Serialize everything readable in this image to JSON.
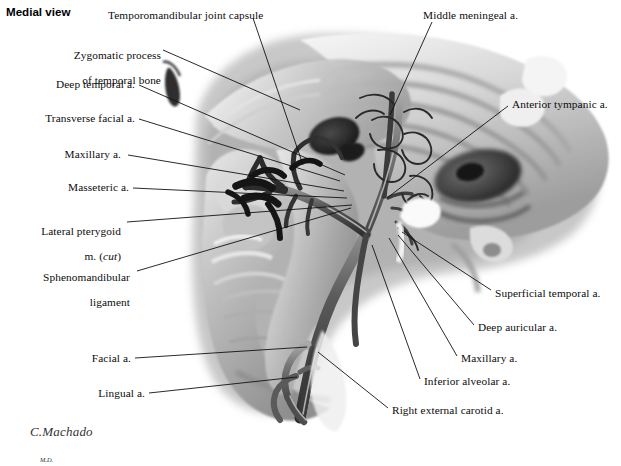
{
  "plate": {
    "title": "Medial view",
    "background_color": "#ffffff",
    "text_color": "#0c0c0c",
    "leader_color": "#111111",
    "width": 621,
    "height": 435
  },
  "signature": {
    "name": "C.Machado",
    "credential": "M.D."
  },
  "labels_left": [
    {
      "id": "zygomatic-process",
      "line1": "Zygomatic process",
      "line2": "of temporal bone",
      "x_right": 161,
      "y": 38
    },
    {
      "id": "deep-temporal-a",
      "text": "Deep temporal a.",
      "x_right": 135,
      "y": 84
    },
    {
      "id": "transverse-facial-a",
      "text": "Transverse facial a.",
      "x_right": 135,
      "y": 118
    },
    {
      "id": "maxillary-a-left",
      "text": "Maxillary a.",
      "x_right": 121,
      "y": 153
    },
    {
      "id": "masseteric-a",
      "text": "Masseteric a.",
      "x_right": 129,
      "y": 186
    },
    {
      "id": "lateral-pterygoid-m",
      "line1": "Lateral pterygoid",
      "line2": "m. (cut)",
      "line2_italic": "cut",
      "x_right": 121,
      "y": 215
    },
    {
      "id": "sphenomandibular-ligament",
      "line1": "Sphenomandibular",
      "line2": "ligament",
      "x_right": 130,
      "y": 262
    },
    {
      "id": "facial-a",
      "text": "Facial a.",
      "x_right": 131,
      "y": 357
    },
    {
      "id": "lingual-a",
      "text": "Lingual a.",
      "x_right": 145,
      "y": 392
    }
  ],
  "labels_top": [
    {
      "id": "temporomandibular-joint-capsule",
      "text": "Temporomandibular joint capsule",
      "x_left": 108,
      "y": 10
    },
    {
      "id": "middle-meningeal-a",
      "text": "Middle meningeal a.",
      "x_left": 423,
      "y": 10
    }
  ],
  "labels_right": [
    {
      "id": "anterior-tympanic-a",
      "text": "Anterior tympanic a.",
      "x_left": 512,
      "y": 103
    },
    {
      "id": "superficial-temporal-a",
      "text": "Superficial temporal a.",
      "x_left": 495,
      "y": 292
    },
    {
      "id": "deep-auricular-a",
      "text": "Deep auricular a.",
      "x_left": 478,
      "y": 327
    },
    {
      "id": "maxillary-a-right",
      "text": "Maxillary a.",
      "x_left": 461,
      "y": 358
    },
    {
      "id": "inferior-alveolar-a",
      "text": "Inferior alveolar a.",
      "x_left": 424,
      "y": 381
    },
    {
      "id": "right-external-carotid-a",
      "text": "Right external carotid a.",
      "x_left": 392,
      "y": 410
    }
  ],
  "leader_lines": [
    {
      "id": "leader-zygomatic-process",
      "points": "163,50 300,110"
    },
    {
      "id": "leader-temporomandibular",
      "points": "253,18 303,165"
    },
    {
      "id": "leader-middle-meningeal",
      "points": "432,22 390,115"
    },
    {
      "id": "leader-deep-temporal",
      "points": "139,85 345,175"
    },
    {
      "id": "leader-transverse-facial",
      "points": "139,119 340,181"
    },
    {
      "id": "leader-maxillary-left",
      "points": "128,155 344,191"
    },
    {
      "id": "leader-masseteric",
      "points": "133,188 347,198"
    },
    {
      "id": "leader-lateral-pterygoid",
      "points": "127,222 352,205"
    },
    {
      "id": "leader-sphenomandibular",
      "points": "137,271 351,208"
    },
    {
      "id": "leader-anterior-tympanic",
      "points": "508,106 387,198"
    },
    {
      "id": "leader-superficial-temporal",
      "points": "491,290 402,232"
    },
    {
      "id": "leader-deep-auricular",
      "points": "474,325 398,235"
    },
    {
      "id": "leader-maxillary-right",
      "points": "457,356 389,238"
    },
    {
      "id": "leader-inferior-alveolar",
      "points": "420,379 372,245"
    },
    {
      "id": "leader-right-external-carotid",
      "points": "388,408 318,352"
    },
    {
      "id": "leader-facial",
      "points": "135,358 307,347"
    },
    {
      "id": "leader-lingual",
      "points": "149,393 297,377"
    }
  ]
}
